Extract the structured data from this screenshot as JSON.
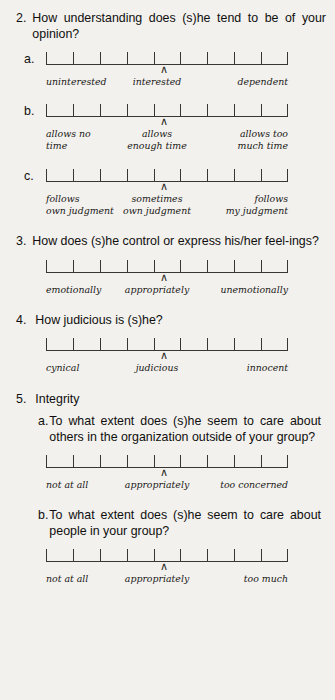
{
  "document": {
    "kind": "survey-questionnaire-page",
    "background_color": "#f2f1ee",
    "text_color": "#100f0d",
    "rule_color": "#39352f",
    "caret_glyph": "∧"
  },
  "scale": {
    "tick_count": 10,
    "interval_count": 9,
    "marker_position_index": 4,
    "marker_label": "∧"
  },
  "questions": [
    {
      "number": "2.",
      "text": "How understanding does (s)he tend to be of your opinion?",
      "items": [
        {
          "letter": "a.",
          "labels": {
            "left": "uninterested",
            "center": "interested",
            "right": "dependent"
          },
          "label_lines": 1
        },
        {
          "letter": "b.",
          "labels": {
            "left": "allows no\ntime",
            "center": "allows\nenough time",
            "right": "allows too\nmuch time"
          },
          "label_lines": 2
        },
        {
          "letter": "c.",
          "labels": {
            "left": "follows\nown judgment",
            "center": "sometimes\nown judgment",
            "right": "follows\nmy judgment"
          },
          "label_lines": 2
        }
      ]
    },
    {
      "number": "3.",
      "text": "How does (s)he control or express his/her feel-ings?",
      "items": [
        {
          "letter": "",
          "labels": {
            "left": "emotionally",
            "center": "appropriately",
            "right": "unemotionally"
          },
          "label_lines": 1
        }
      ]
    },
    {
      "number": "4.",
      "text": "How judicious is (s)he?",
      "items": [
        {
          "letter": "",
          "labels": {
            "left": "cynical",
            "center": "judicious",
            "right": "innocent"
          },
          "label_lines": 1
        }
      ]
    },
    {
      "number": "5.",
      "text": "Integrity",
      "subquestions": [
        {
          "letter": "a.",
          "text": "To what extent does (s)he seem to care about others in the organization outside of your group?",
          "labels": {
            "left": "not at all",
            "center": "appropriately",
            "right": "too concerned"
          },
          "label_lines": 1
        },
        {
          "letter": "b.",
          "text": "To what extent does (s)he seem to care about people in your group?",
          "labels": {
            "left": "not at all",
            "center": "appropriately",
            "right": "too much"
          },
          "label_lines": 1
        }
      ]
    }
  ]
}
